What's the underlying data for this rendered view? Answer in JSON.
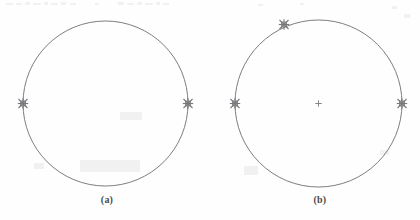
{
  "figure": {
    "background_color": "#fefefe",
    "stroke_color": "#6e6e72",
    "marker_color": "#78787c",
    "caption_color": "#4a4a4a",
    "panels": [
      {
        "id": "a",
        "caption": "(a)",
        "circle": {
          "cx": 105.5,
          "cy": 103.5,
          "r": 82.5
        },
        "center_cross": false,
        "markers": [
          {
            "name": "marker-left",
            "x": 23.0,
            "y": 103.5,
            "angle_deg": 180
          },
          {
            "name": "marker-right",
            "x": 188.0,
            "y": 103.5,
            "angle_deg": 0
          }
        ]
      },
      {
        "id": "b",
        "caption": "(b)",
        "circle": {
          "cx": 318.5,
          "cy": 103.5,
          "r": 83.5
        },
        "center_cross": true,
        "center_cross_point": {
          "x": 318.5,
          "y": 103.5
        },
        "markers": [
          {
            "name": "marker-left",
            "x": 235.0,
            "y": 103.5,
            "angle_deg": 180
          },
          {
            "name": "marker-right",
            "x": 402.0,
            "y": 103.5,
            "angle_deg": 0
          },
          {
            "name": "marker-upper-left",
            "x": 284.0,
            "y": 24.5,
            "angle_deg": 115
          }
        ]
      }
    ],
    "marker_glyph": "eight-point-star",
    "marker_size": 9
  },
  "artifacts": {
    "description": "faint scanner bleed-through speckles along top edge",
    "speckles": [
      {
        "x": 6,
        "y": 3,
        "w": 7,
        "h": 2
      },
      {
        "x": 16,
        "y": 3,
        "w": 6,
        "h": 2
      },
      {
        "x": 25,
        "y": 2,
        "w": 5,
        "h": 3
      },
      {
        "x": 33,
        "y": 3,
        "w": 8,
        "h": 2
      },
      {
        "x": 44,
        "y": 2,
        "w": 4,
        "h": 3
      },
      {
        "x": 51,
        "y": 3,
        "w": 7,
        "h": 2
      },
      {
        "x": 61,
        "y": 2,
        "w": 5,
        "h": 3
      },
      {
        "x": 70,
        "y": 3,
        "w": 6,
        "h": 2
      },
      {
        "x": 95,
        "y": 3,
        "w": 4,
        "h": 2
      },
      {
        "x": 118,
        "y": 2,
        "w": 6,
        "h": 3
      },
      {
        "x": 127,
        "y": 3,
        "w": 7,
        "h": 2
      },
      {
        "x": 137,
        "y": 2,
        "w": 5,
        "h": 3
      },
      {
        "x": 145,
        "y": 3,
        "w": 8,
        "h": 2
      },
      {
        "x": 156,
        "y": 2,
        "w": 4,
        "h": 3
      },
      {
        "x": 163,
        "y": 3,
        "w": 6,
        "h": 2
      },
      {
        "x": 258,
        "y": 4,
        "w": 5,
        "h": 2
      },
      {
        "x": 300,
        "y": 3,
        "w": 4,
        "h": 2
      },
      {
        "x": 392,
        "y": 6,
        "w": 5,
        "h": 3
      },
      {
        "x": 404,
        "y": 14,
        "w": 6,
        "h": 4
      },
      {
        "x": 380,
        "y": 150,
        "w": 9,
        "h": 5
      },
      {
        "x": 34,
        "y": 163,
        "w": 10,
        "h": 6
      },
      {
        "x": 120,
        "y": 112,
        "w": 22,
        "h": 8
      },
      {
        "x": 80,
        "y": 160,
        "w": 60,
        "h": 12
      },
      {
        "x": 244,
        "y": 166,
        "w": 14,
        "h": 9
      }
    ]
  }
}
